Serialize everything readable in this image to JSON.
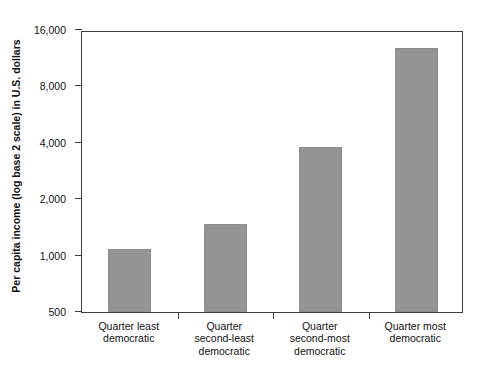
{
  "chart_data": {
    "type": "bar",
    "title": "",
    "xlabel": "",
    "ylabel": "Per capita income (log base 2 scale) in U.S. dollars",
    "categories": [
      "Quarter least democratic",
      "Quarter second-least democratic",
      "Quarter second-most democratic",
      "Quarter most democratic"
    ],
    "category_lines": [
      [
        "Quarter least",
        "democratic"
      ],
      [
        "Quarter",
        "second-least",
        "democratic"
      ],
      [
        "Quarter",
        "second-most",
        "democratic"
      ],
      [
        "Quarter most",
        "democratic"
      ]
    ],
    "values": [
      1080,
      1480,
      3800,
      12900
    ],
    "yscale": "log2",
    "ylim": [
      500,
      16000
    ],
    "yticks": [
      500,
      1000,
      2000,
      4000,
      8000,
      16000
    ],
    "ytick_labels": [
      "500",
      "1,000",
      "2,000",
      "4,000",
      "8,000",
      "16,000"
    ],
    "grid": false,
    "legend": false,
    "bar_color": "#949494",
    "axis_color": "#3d3d3d",
    "background": "#ffffff"
  },
  "caption": {
    "text": ""
  }
}
